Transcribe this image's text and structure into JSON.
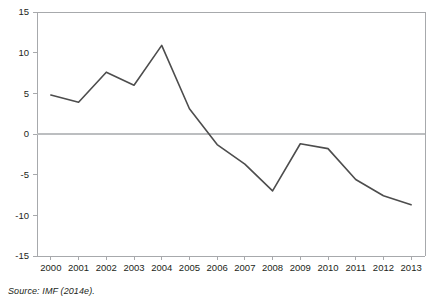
{
  "source_note": "Source: IMF (2014e).",
  "chart_data": {
    "type": "line",
    "title": "",
    "subtitle": "",
    "xlabel": "",
    "ylabel": "",
    "categories": [
      "2000",
      "2001",
      "2002",
      "2003",
      "2004",
      "2005",
      "2006",
      "2007",
      "2008",
      "2009",
      "2010",
      "2011",
      "2012",
      "2013"
    ],
    "x": [
      2000,
      2001,
      2002,
      2003,
      2004,
      2005,
      2006,
      2007,
      2008,
      2009,
      2010,
      2011,
      2012,
      2013
    ],
    "values": [
      4.8,
      3.9,
      7.6,
      6.0,
      10.9,
      3.1,
      -1.3,
      -3.7,
      -7.0,
      -1.2,
      -1.8,
      -5.6,
      -7.6,
      -8.7
    ],
    "series": [
      {
        "name": "value",
        "values": [
          4.8,
          3.9,
          7.6,
          6.0,
          10.9,
          3.1,
          -1.3,
          -3.7,
          -7.0,
          -1.2,
          -1.8,
          -5.6,
          -7.6,
          -8.7
        ],
        "color": "#4d4d4d"
      }
    ],
    "ylim": [
      -15,
      15
    ],
    "yticks": [
      15,
      10,
      5,
      0,
      -5,
      -10,
      -15
    ],
    "ytick_labels": [
      "15",
      "10",
      "5",
      "0",
      "-5",
      "-10",
      "-15"
    ],
    "xtick_labels": [
      "2000",
      "2001",
      "2002",
      "2003",
      "2004",
      "2005",
      "2006",
      "2007",
      "2008",
      "2009",
      "2010",
      "2011",
      "2012",
      "2013"
    ],
    "grid": false,
    "zero_line": true,
    "legend": null,
    "legend_position": "none",
    "colors": {
      "line": "#4d4d4d",
      "axis": "#a7a9ac",
      "zero_line": "#bcbec0",
      "text": "#231f20",
      "background": "#ffffff"
    }
  }
}
